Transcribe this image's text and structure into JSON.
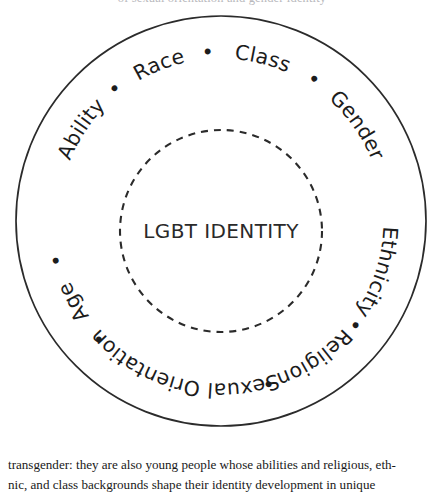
{
  "figure": {
    "type": "concentric-circle-diagram",
    "core_label": "LGBT IDENTITY",
    "separator_glyph": "•",
    "ring_labels": [
      "Ability",
      "Race",
      "Class",
      "Gender",
      "Ethnicity",
      "Religion",
      "Sexual Orientation",
      "Age"
    ],
    "colors": {
      "stroke": "#2b2b2b",
      "text": "#1c1c1c",
      "background": "#ffffff"
    }
  },
  "caption": {
    "line1": "transgender: they are also young people whose abilities and religious, eth-",
    "line2": "nic, and class backgrounds shape their identity development in unique"
  },
  "cropped_text_above": "of sexual orientation and gender identity"
}
